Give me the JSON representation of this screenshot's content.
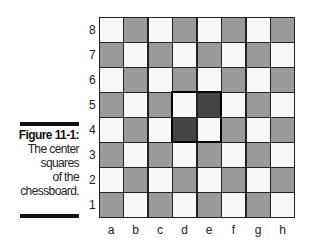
{
  "figure": {
    "label": "Figure 11-1:",
    "caption_lines": [
      "The center",
      "squares",
      "of the",
      "chessboard."
    ]
  },
  "board": {
    "ranks": [
      "8",
      "7",
      "6",
      "5",
      "4",
      "3",
      "2",
      "1"
    ],
    "files": [
      "a",
      "b",
      "c",
      "d",
      "e",
      "f",
      "g",
      "h"
    ],
    "highlighted_squares": [
      "d5",
      "e5",
      "d4",
      "e4"
    ],
    "colors": {
      "light": "#f8f8f8",
      "dark": "#9a9a9a",
      "center_dark": "#454545",
      "grid_line": "#222222",
      "highlight_border": "#000000"
    }
  }
}
